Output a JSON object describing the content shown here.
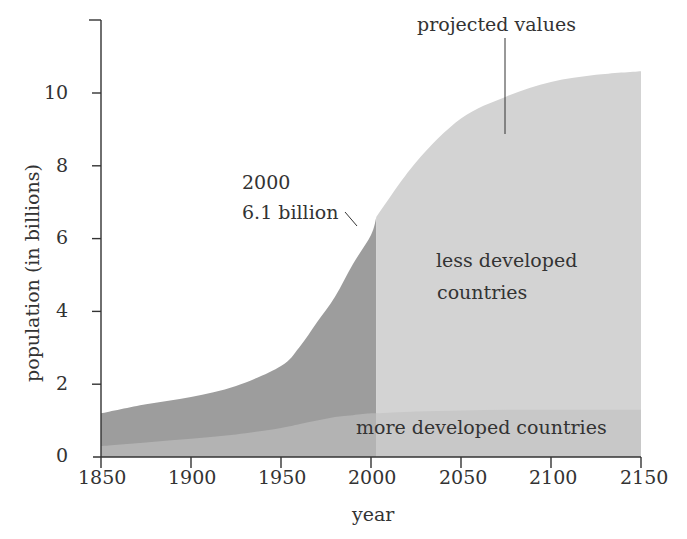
{
  "chart_data": {
    "type": "area",
    "title": "",
    "xlabel": "year",
    "ylabel": "population (in billions)",
    "xlim": [
      1850,
      2150
    ],
    "ylim": [
      0,
      12
    ],
    "x_ticks": [
      "1850",
      "1900",
      "1950",
      "2000",
      "2050",
      "2100",
      "2150"
    ],
    "y_ticks": [
      "0",
      "2",
      "4",
      "6",
      "8",
      "10"
    ],
    "grid": false,
    "x": [
      1850,
      1875,
      1900,
      1925,
      1950,
      1960,
      1970,
      1980,
      1990,
      2000,
      2003,
      2025,
      2050,
      2075,
      2100,
      2125,
      2150
    ],
    "series": [
      {
        "name": "more developed countries",
        "values": [
          0.3,
          0.4,
          0.5,
          0.62,
          0.8,
          0.9,
          1.0,
          1.1,
          1.15,
          1.2,
          1.2,
          1.25,
          1.28,
          1.3,
          1.3,
          1.3,
          1.3
        ]
      },
      {
        "name": "total (less + more developed countries)",
        "values": [
          1.2,
          1.45,
          1.65,
          1.95,
          2.5,
          3.0,
          3.7,
          4.4,
          5.3,
          6.1,
          6.6,
          8.1,
          9.3,
          9.9,
          10.3,
          10.5,
          10.6
        ]
      }
    ],
    "regions": [
      {
        "name": "historical",
        "x_range": [
          1850,
          2003
        ]
      },
      {
        "name": "projected values",
        "x_range": [
          2003,
          2150
        ]
      }
    ],
    "annotations": [
      {
        "text": "2000\n6.1 billion",
        "x": 2000,
        "y": 6.1
      },
      {
        "text": "projected values",
        "x": 2070,
        "y": 9.5
      },
      {
        "text": "less developed countries",
        "x": 2075,
        "y": 5.5
      },
      {
        "text": "more developed countries",
        "x": 2085,
        "y": 0.7
      }
    ]
  },
  "labels": {
    "xlabel": "year",
    "ylabel": "population (in billions)",
    "x_ticks": [
      "1850",
      "1900",
      "1950",
      "2000",
      "2050",
      "2100",
      "2150"
    ],
    "y_ticks": [
      "0",
      "2",
      "4",
      "6",
      "8",
      "10"
    ],
    "ann_2000_line1": "2000",
    "ann_2000_line2": "6.1 billion",
    "ann_projected": "projected values",
    "ann_less_line1": "less developed",
    "ann_less_line2": "countries",
    "ann_more": "more developed countries"
  },
  "colors": {
    "historical_less": "#9d9d9d",
    "historical_more": "#b3b3b3",
    "projected_less": "#d3d3d3",
    "projected_more": "#c8c8c8",
    "axis": "#333333"
  }
}
